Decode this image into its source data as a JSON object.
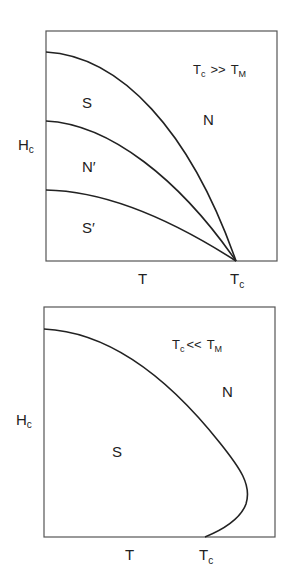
{
  "diagrams": [
    {
      "condition": {
        "left": "T",
        "left_sub": "c",
        "op": ">>",
        "right": "T",
        "right_sub": "M"
      },
      "y_axis_label": {
        "main": "H",
        "sub": "c"
      },
      "x_axis_label": "T",
      "x_tick_label": {
        "main": "T",
        "sub": "c"
      },
      "regions": [
        {
          "label": "S"
        },
        {
          "label": "N"
        },
        {
          "label": "N′"
        },
        {
          "label": "S′"
        }
      ]
    },
    {
      "condition": {
        "left": "T",
        "left_sub": "c",
        "op": "<<",
        "right": "T",
        "right_sub": "M"
      },
      "y_axis_label": {
        "main": "H",
        "sub": "c"
      },
      "x_axis_label": "T",
      "x_tick_label": {
        "main": "T",
        "sub": "c"
      },
      "regions": [
        {
          "label": "S"
        },
        {
          "label": "N"
        }
      ]
    }
  ],
  "colors": {
    "line": "#222222",
    "frame": "#555555",
    "background": "#ffffff"
  }
}
